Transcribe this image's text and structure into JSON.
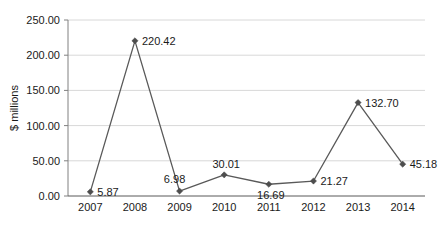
{
  "chart_data": {
    "type": "line",
    "title": "",
    "xlabel": "",
    "ylabel": "$ millions",
    "categories": [
      "2007",
      "2008",
      "2009",
      "2010",
      "2011",
      "2012",
      "2013",
      "2014"
    ],
    "values": [
      5.87,
      220.42,
      6.98,
      30.01,
      16.69,
      21.27,
      132.7,
      45.18
    ],
    "data_labels": [
      "5.87",
      "220.42",
      "6.98",
      "30.01",
      "16.69",
      "21.27",
      "132.70",
      "45.18"
    ],
    "ylim": [
      0,
      250
    ],
    "ytick_step": 50,
    "ytick_labels": [
      "0.00",
      "50.00",
      "100.00",
      "150.00",
      "200.00",
      "250.00"
    ],
    "xtick_labels": [
      "2007",
      "2008",
      "2009",
      "2010",
      "2011",
      "2012",
      "2013",
      "2014"
    ],
    "grid": "horizontal",
    "legend": "none",
    "series_name": "",
    "marker": "diamond",
    "colors": {
      "line": "#595959",
      "marker": "#4d4d4d",
      "grid": "#d8d8d8",
      "axis": "#808080",
      "text": "#1a1a1a",
      "background": "#ffffff"
    },
    "label_placement": [
      "right",
      "right",
      "above-left",
      "above",
      "below",
      "right",
      "right",
      "right"
    ]
  }
}
